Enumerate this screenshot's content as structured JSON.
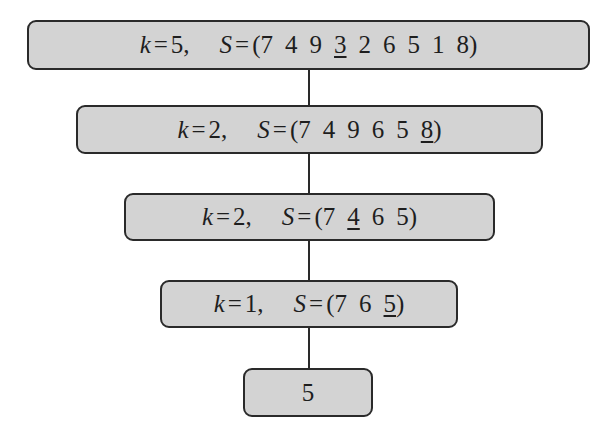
{
  "diagram": {
    "title": "",
    "nodes": [
      {
        "k": "5",
        "S_prefix": "(",
        "elements": [
          "7",
          "4",
          "9",
          "3",
          "2",
          "6",
          "5",
          "1",
          "8"
        ],
        "underlined_index": 3,
        "S_suffix": ")"
      },
      {
        "k": "2",
        "S_prefix": "(",
        "elements": [
          "7",
          "4",
          "9",
          "6",
          "5",
          "8"
        ],
        "underlined_index": 5,
        "S_suffix": ")"
      },
      {
        "k": "2",
        "S_prefix": "(",
        "elements": [
          "7",
          "4",
          "6",
          "5"
        ],
        "underlined_index": 1,
        "S_suffix": ")"
      },
      {
        "k": "1",
        "S_prefix": "(",
        "elements": [
          "7",
          "6",
          "5"
        ],
        "underlined_index": 2,
        "S_suffix": ")"
      }
    ],
    "result": "5",
    "labels": {
      "k_var": "k",
      "S_var": "S",
      "equals": "=",
      "comma": ","
    },
    "colors": {
      "box_fill": "#d3d3d3",
      "box_border": "#2a2a2a",
      "connector": "#2a2a2a"
    }
  }
}
